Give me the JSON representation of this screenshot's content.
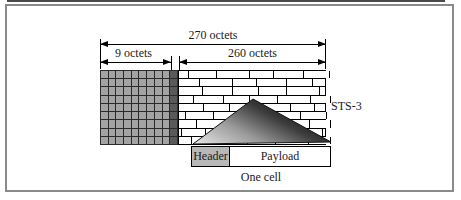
{
  "figure": {
    "dimensions": {
      "total": "270 octets",
      "overhead": "9 octets",
      "payload": "260 octets"
    },
    "frame_label": "STS-3",
    "cell": {
      "header": "Header",
      "payload": "Payload",
      "caption": "One cell"
    }
  },
  "colors": {
    "border": "#8a8a8a",
    "grid_cell": "#a3a3a3",
    "grid_dark_col": "#5a5a5a",
    "header_fill": "#b8b8b8",
    "triangle_light": "#e8e8e8",
    "triangle_dark": "#0a0a0a"
  }
}
